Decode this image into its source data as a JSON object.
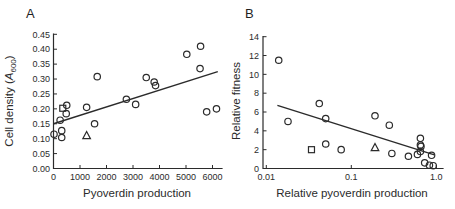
{
  "figure": {
    "panel_a_label": "A",
    "panel_b_label": "B",
    "ink": "#2b2b2b",
    "background": "#ffffff"
  },
  "chart_data": [
    {
      "panel": "A",
      "type": "scatter",
      "title": "",
      "xlabel": "Pyoverdin production",
      "ylabel": "Cell density (A600)",
      "ylabel_parts": [
        {
          "text": "Cell density ("
        },
        {
          "text": "A",
          "italic": true
        },
        {
          "text": "600",
          "sub": true
        },
        {
          "text": ")",
          "after_sub": true
        }
      ],
      "xscale": "linear",
      "xlim": [
        0,
        6300
      ],
      "ylim": [
        0,
        0.45
      ],
      "grid": false,
      "legend": "none",
      "xticks": [
        "0",
        "1000",
        "2000",
        "3000",
        "4000",
        "5000",
        "6000"
      ],
      "xtick_values": [
        0,
        1000,
        2000,
        3000,
        4000,
        5000,
        6000
      ],
      "yticks": [
        "0.00",
        "0.05",
        "0.10",
        "0.15",
        "0.20",
        "0.25",
        "0.30",
        "0.35",
        "0.40",
        "0.45"
      ],
      "ytick_values": [
        0,
        0.05,
        0.1,
        0.15,
        0.2,
        0.25,
        0.3,
        0.35,
        0.4,
        0.45
      ],
      "series": [
        {
          "name": "circles",
          "marker": "circle",
          "points": [
            [
              500,
              0.212
            ],
            [
              480,
              0.184
            ],
            [
              250,
              0.162
            ],
            [
              20,
              0.115
            ],
            [
              310,
              0.127
            ],
            [
              310,
              0.104
            ],
            [
              1250,
              0.205
            ],
            [
              1550,
              0.15
            ],
            [
              1650,
              0.308
            ],
            [
              2750,
              0.232
            ],
            [
              3100,
              0.215
            ],
            [
              3500,
              0.305
            ],
            [
              3800,
              0.29
            ],
            [
              3850,
              0.278
            ],
            [
              5030,
              0.383
            ],
            [
              5550,
              0.41
            ],
            [
              5530,
              0.335
            ],
            [
              5780,
              0.19
            ],
            [
              6150,
              0.2
            ]
          ]
        },
        {
          "name": "square",
          "marker": "square",
          "points": [
            [
              350,
              0.202
            ]
          ]
        },
        {
          "name": "triangle",
          "marker": "triangle",
          "points": [
            [
              1250,
              0.11
            ]
          ]
        }
      ],
      "trendline": [
        [
          0,
          0.15
        ],
        [
          6200,
          0.325
        ]
      ]
    },
    {
      "panel": "B",
      "type": "scatter",
      "title": "",
      "xlabel": "Relative pyoverdin production",
      "ylabel": "Relative fitness",
      "ylabel_parts": [
        {
          "text": "Relative fitness"
        }
      ],
      "xscale": "log",
      "xlim": [
        0.01,
        1.1
      ],
      "ylim": [
        0,
        14
      ],
      "grid": false,
      "legend": "none",
      "xticks": [
        "0.01",
        "0.1",
        "1.0"
      ],
      "xtick_values": [
        0.01,
        0.1,
        1.0
      ],
      "yticks": [
        "0",
        "2",
        "4",
        "6",
        "8",
        "10",
        "12",
        "14"
      ],
      "ytick_values": [
        0,
        2,
        4,
        6,
        8,
        10,
        12,
        14
      ],
      "series": [
        {
          "name": "circles",
          "marker": "circle",
          "points": [
            [
              0.014,
              11.5
            ],
            [
              0.018,
              5.0
            ],
            [
              0.042,
              6.9
            ],
            [
              0.05,
              5.3
            ],
            [
              0.05,
              2.6
            ],
            [
              0.076,
              2.0
            ],
            [
              0.19,
              5.6
            ],
            [
              0.28,
              4.6
            ],
            [
              0.3,
              1.6
            ],
            [
              0.47,
              1.3
            ],
            [
              0.6,
              1.5
            ],
            [
              0.65,
              3.2
            ],
            [
              0.65,
              2.5
            ],
            [
              0.66,
              2.35
            ],
            [
              0.65,
              1.8
            ],
            [
              0.88,
              1.4
            ],
            [
              0.73,
              0.6
            ],
            [
              0.83,
              0.35
            ],
            [
              0.92,
              0.3
            ]
          ]
        },
        {
          "name": "square",
          "marker": "square",
          "points": [
            [
              0.034,
              2.0
            ]
          ]
        },
        {
          "name": "triangle",
          "marker": "triangle",
          "points": [
            [
              0.19,
              2.2
            ]
          ]
        }
      ],
      "trendline": [
        [
          0.0135,
          6.7
        ],
        [
          0.95,
          1.45
        ]
      ]
    }
  ]
}
